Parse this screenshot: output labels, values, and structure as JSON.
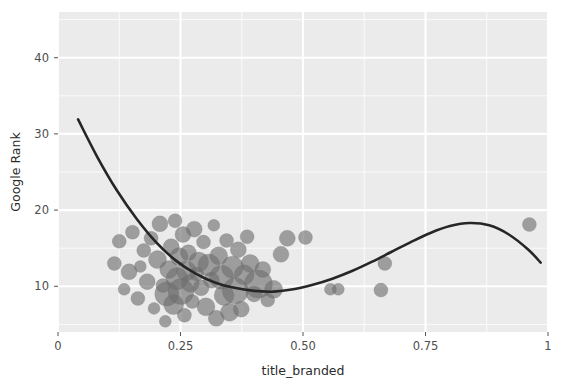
{
  "chart_data": {
    "type": "scatter",
    "title": "",
    "xlabel": "title_branded",
    "ylabel": "Google Rank",
    "xlim": [
      0,
      1
    ],
    "ylim": [
      46,
      4
    ],
    "y_reversed": true,
    "grid": true,
    "legend": null,
    "xticks": [
      0,
      0.25,
      0.5,
      0.75,
      1
    ],
    "xtick_labels": [
      "0",
      "0.25",
      "0.50",
      "0.75",
      "1"
    ],
    "yticks": [
      10,
      20,
      30,
      40
    ],
    "ytick_labels": [
      "10",
      "20",
      "30",
      "40"
    ],
    "point_color": "#6e6e6e",
    "point_opacity": 0.62,
    "line_color": "#262626",
    "panel_color": "#ebebeb",
    "grid_color": "#ffffff",
    "size_encoding": "bubble area varies by weight",
    "points": [
      {
        "x": 0.115,
        "y": 13.0,
        "r": 7
      },
      {
        "x": 0.125,
        "y": 15.9,
        "r": 7
      },
      {
        "x": 0.135,
        "y": 9.6,
        "r": 6
      },
      {
        "x": 0.145,
        "y": 11.9,
        "r": 8
      },
      {
        "x": 0.152,
        "y": 17.1,
        "r": 7
      },
      {
        "x": 0.163,
        "y": 8.4,
        "r": 7
      },
      {
        "x": 0.168,
        "y": 12.6,
        "r": 6
      },
      {
        "x": 0.175,
        "y": 14.7,
        "r": 7
      },
      {
        "x": 0.182,
        "y": 10.6,
        "r": 8
      },
      {
        "x": 0.19,
        "y": 16.3,
        "r": 7
      },
      {
        "x": 0.196,
        "y": 7.1,
        "r": 6
      },
      {
        "x": 0.203,
        "y": 13.5,
        "r": 9
      },
      {
        "x": 0.208,
        "y": 18.2,
        "r": 8
      },
      {
        "x": 0.214,
        "y": 10.1,
        "r": 7
      },
      {
        "x": 0.219,
        "y": 5.4,
        "r": 6
      },
      {
        "x": 0.222,
        "y": 9.0,
        "r": 12
      },
      {
        "x": 0.226,
        "y": 12.2,
        "r": 9
      },
      {
        "x": 0.231,
        "y": 15.2,
        "r": 8
      },
      {
        "x": 0.236,
        "y": 7.6,
        "r": 10
      },
      {
        "x": 0.239,
        "y": 18.6,
        "r": 7
      },
      {
        "x": 0.243,
        "y": 11.0,
        "r": 11
      },
      {
        "x": 0.247,
        "y": 13.9,
        "r": 9
      },
      {
        "x": 0.251,
        "y": 9.3,
        "r": 13
      },
      {
        "x": 0.255,
        "y": 16.8,
        "r": 8
      },
      {
        "x": 0.258,
        "y": 6.2,
        "r": 7
      },
      {
        "x": 0.262,
        "y": 12.0,
        "r": 10
      },
      {
        "x": 0.266,
        "y": 14.4,
        "r": 8
      },
      {
        "x": 0.27,
        "y": 10.4,
        "r": 9
      },
      {
        "x": 0.274,
        "y": 8.0,
        "r": 7
      },
      {
        "x": 0.278,
        "y": 17.5,
        "r": 8
      },
      {
        "x": 0.283,
        "y": 11.6,
        "r": 7
      },
      {
        "x": 0.287,
        "y": 13.2,
        "r": 10
      },
      {
        "x": 0.292,
        "y": 9.8,
        "r": 8
      },
      {
        "x": 0.297,
        "y": 15.8,
        "r": 7
      },
      {
        "x": 0.302,
        "y": 7.3,
        "r": 9
      },
      {
        "x": 0.308,
        "y": 12.8,
        "r": 11
      },
      {
        "x": 0.313,
        "y": 10.8,
        "r": 8
      },
      {
        "x": 0.318,
        "y": 18.0,
        "r": 6
      },
      {
        "x": 0.323,
        "y": 5.8,
        "r": 8
      },
      {
        "x": 0.328,
        "y": 14.0,
        "r": 9
      },
      {
        "x": 0.334,
        "y": 11.2,
        "r": 12
      },
      {
        "x": 0.339,
        "y": 8.8,
        "r": 10
      },
      {
        "x": 0.344,
        "y": 16.0,
        "r": 7
      },
      {
        "x": 0.35,
        "y": 6.6,
        "r": 9
      },
      {
        "x": 0.356,
        "y": 12.5,
        "r": 11
      },
      {
        "x": 0.362,
        "y": 9.4,
        "r": 13
      },
      {
        "x": 0.368,
        "y": 14.8,
        "r": 8
      },
      {
        "x": 0.374,
        "y": 7.0,
        "r": 8
      },
      {
        "x": 0.38,
        "y": 11.5,
        "r": 10
      },
      {
        "x": 0.386,
        "y": 16.5,
        "r": 7
      },
      {
        "x": 0.392,
        "y": 13.0,
        "r": 9
      },
      {
        "x": 0.4,
        "y": 9.0,
        "r": 8
      },
      {
        "x": 0.409,
        "y": 10.3,
        "r": 14
      },
      {
        "x": 0.418,
        "y": 12.2,
        "r": 8
      },
      {
        "x": 0.428,
        "y": 8.2,
        "r": 7
      },
      {
        "x": 0.44,
        "y": 9.6,
        "r": 9
      },
      {
        "x": 0.455,
        "y": 14.2,
        "r": 8
      },
      {
        "x": 0.468,
        "y": 16.3,
        "r": 8
      },
      {
        "x": 0.505,
        "y": 16.4,
        "r": 7
      },
      {
        "x": 0.556,
        "y": 9.6,
        "r": 6
      },
      {
        "x": 0.572,
        "y": 9.6,
        "r": 6
      },
      {
        "x": 0.659,
        "y": 9.5,
        "r": 7
      },
      {
        "x": 0.667,
        "y": 13.0,
        "r": 7
      },
      {
        "x": 0.962,
        "y": 18.1,
        "r": 7
      }
    ],
    "trend_line": [
      {
        "x": 0.041,
        "y": 31.9
      },
      {
        "x": 0.08,
        "y": 27.0
      },
      {
        "x": 0.12,
        "y": 22.6
      },
      {
        "x": 0.16,
        "y": 18.9
      },
      {
        "x": 0.2,
        "y": 15.8
      },
      {
        "x": 0.24,
        "y": 13.4
      },
      {
        "x": 0.28,
        "y": 11.7
      },
      {
        "x": 0.32,
        "y": 10.5
      },
      {
        "x": 0.36,
        "y": 9.8
      },
      {
        "x": 0.4,
        "y": 9.4
      },
      {
        "x": 0.44,
        "y": 9.3
      },
      {
        "x": 0.48,
        "y": 9.6
      },
      {
        "x": 0.52,
        "y": 10.2
      },
      {
        "x": 0.56,
        "y": 11.0
      },
      {
        "x": 0.6,
        "y": 12.0
      },
      {
        "x": 0.64,
        "y": 13.2
      },
      {
        "x": 0.68,
        "y": 14.5
      },
      {
        "x": 0.72,
        "y": 15.8
      },
      {
        "x": 0.76,
        "y": 17.0
      },
      {
        "x": 0.8,
        "y": 17.9
      },
      {
        "x": 0.84,
        "y": 18.3
      },
      {
        "x": 0.88,
        "y": 18.0
      },
      {
        "x": 0.92,
        "y": 16.8
      },
      {
        "x": 0.96,
        "y": 14.8
      },
      {
        "x": 0.985,
        "y": 13.1
      }
    ]
  }
}
